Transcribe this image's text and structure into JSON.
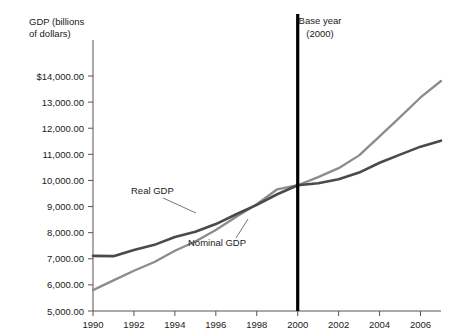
{
  "chart_data": {
    "type": "line",
    "title": "",
    "xlabel": "",
    "ylabel": "GDP (billions of dollars)",
    "ylabel_line1": "GDP (billions",
    "ylabel_line2": "of dollars)",
    "xlim": [
      1990,
      2007
    ],
    "ylim": [
      5000,
      14000
    ],
    "grid": false,
    "legend_position": "inline-annotations",
    "y_ticks": [
      5000,
      6000,
      7000,
      8000,
      9000,
      10000,
      11000,
      12000,
      13000,
      14000
    ],
    "y_tick_labels": [
      "5,000.00",
      "6,000.00",
      "7,000.00",
      "8,000.00",
      "9,000.00",
      "10,000.00",
      "11,000.00",
      "12,000.00",
      "13,000.00",
      "$14,000.00"
    ],
    "x_ticks": [
      1990,
      1992,
      1994,
      1996,
      1998,
      2000,
      2002,
      2004,
      2006
    ],
    "x_tick_labels": [
      "1990",
      "1992",
      "1994",
      "1996",
      "1998",
      "2000",
      "2002",
      "2004",
      "2006"
    ],
    "x": [
      1990,
      1991,
      1992,
      1993,
      1994,
      1995,
      1996,
      1997,
      1998,
      1999,
      2000,
      2001,
      2002,
      2003,
      2004,
      2005,
      2006,
      2007
    ],
    "series": [
      {
        "name": "Real GDP",
        "color": "#4a4a4a",
        "width": 2.6,
        "values": [
          7113,
          7101,
          7337,
          7533,
          7836,
          8032,
          8329,
          8704,
          9067,
          9470,
          9817,
          9891,
          10049,
          10301,
          10676,
          10990,
          11295,
          11524
        ]
      },
      {
        "name": "Nominal GDP",
        "color": "#8c8c8c",
        "width": 2.3,
        "values": [
          5800,
          6174,
          6539,
          6879,
          7309,
          7664,
          8100,
          8609,
          9089,
          9661,
          9817,
          10128,
          10470,
          10961,
          11686,
          12422,
          13178,
          13808
        ]
      }
    ],
    "annotations": [
      {
        "name": "base-year",
        "line1": "Base year",
        "line2": "(2000)",
        "x_value": 2000,
        "color": "#000000"
      },
      {
        "name": "real-gdp-label",
        "text": "Real GDP"
      },
      {
        "name": "nominal-gdp-label",
        "text": "Nominal GDP"
      }
    ]
  }
}
